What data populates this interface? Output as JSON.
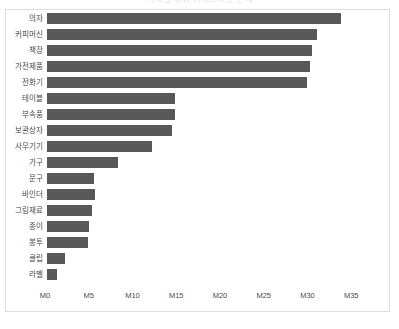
{
  "chart_data": {
    "type": "bar",
    "orientation": "horizontal",
    "title": "지역별 총합 카테고리별 판매",
    "xlabel": "",
    "ylabel": "",
    "categories": [
      "의자",
      "커피머신",
      "책장",
      "가전제품",
      "전화기",
      "테이블",
      "부속품",
      "보관상자",
      "사무기기",
      "가구",
      "문구",
      "바인더",
      "그림재료",
      "종이",
      "봉투",
      "클립",
      "라벨"
    ],
    "values": [
      33.6,
      30.8,
      30.3,
      30.1,
      29.7,
      14.6,
      14.6,
      14.3,
      12.0,
      8.1,
      5.4,
      5.5,
      5.1,
      4.8,
      4.7,
      2.1,
      1.1
    ],
    "tick_labels": [
      "M0",
      "M5",
      "M10",
      "M15",
      "M20",
      "M25",
      "M30",
      "M35"
    ],
    "tick_values": [
      0,
      5,
      10,
      15,
      20,
      25,
      30,
      35
    ],
    "xlim": [
      0,
      39.2
    ],
    "grid": false,
    "legend": false,
    "bar_color": "#58585a",
    "frame_color": "#dcdcdc",
    "background": "#ffffff",
    "text_color": "#4b4b4d"
  }
}
